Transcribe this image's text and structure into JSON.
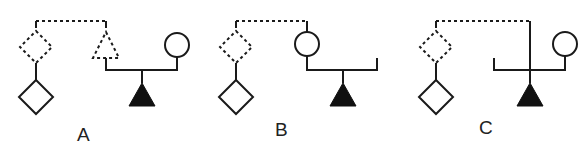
{
  "diagram": {
    "type": "pedigree",
    "colors": {
      "stroke": "#1a1a1a",
      "fill": "#111111",
      "background": "#ffffff"
    },
    "panels": [
      {
        "label": "A",
        "description": "Dashed diamond parent and dashed triangle sibling linked by dotted line; solid diamond child below dashed diamond; dashed triangle mates with circle, producing filled triangle offspring"
      },
      {
        "label": "B",
        "description": "Dashed diamond and circle linked by dotted line; solid diamond child below dashed diamond; circle line descends to sibship with filled triangle and open-ended right branch"
      },
      {
        "label": "C",
        "description": "Dashed diamond linked by dotted line to vertical descent line directly to filled triangle; sibship line with open left branch and circle on right"
      }
    ]
  }
}
